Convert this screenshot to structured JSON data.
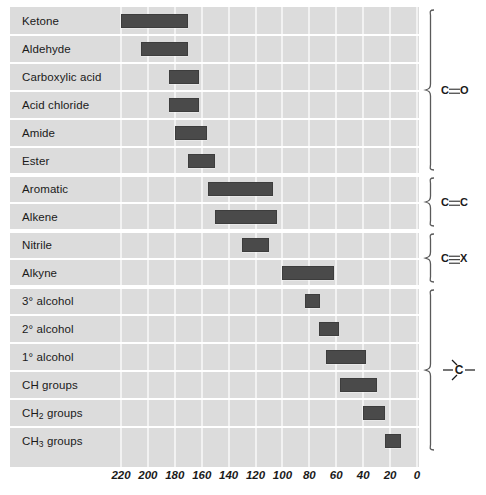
{
  "chart_data": {
    "type": "bar",
    "orientation": "horizontal-range",
    "title": "",
    "xlabel": "",
    "ylabel": "",
    "xlim": [
      220,
      0
    ],
    "x_reversed": true,
    "grid": true,
    "legend_position": "none",
    "tick_labels": [
      "220",
      "200",
      "180",
      "160",
      "140",
      "120",
      "100",
      "80",
      "60",
      "40",
      "20",
      "0"
    ],
    "ticks": [
      220,
      200,
      180,
      160,
      140,
      120,
      100,
      80,
      60,
      40,
      20,
      0
    ],
    "bar_color": "#4a4a4a",
    "plot_background": "#dcdcdc",
    "gridline_color": "#f2f2f2",
    "categories": [
      "Ketone",
      "Aldehyde",
      "Carboxylic acid",
      "Acid chloride",
      "Amide",
      "Ester",
      "Aromatic",
      "Alkene",
      "Nitrile",
      "Alkyne",
      "3° alcohol",
      "2° alcohol",
      "1° alcohol",
      "CH groups",
      "CH2 groups",
      "CH3 groups"
    ],
    "ranges": [
      {
        "label": "Ketone",
        "start": 220,
        "end": 170
      },
      {
        "label": "Aldehyde",
        "start": 205,
        "end": 170
      },
      {
        "label": "Carboxylic acid",
        "start": 184,
        "end": 162
      },
      {
        "label": "Acid chloride",
        "start": 184,
        "end": 162
      },
      {
        "label": "Amide",
        "start": 180,
        "end": 156
      },
      {
        "label": "Ester",
        "start": 170,
        "end": 150
      },
      {
        "label": "Aromatic",
        "start": 155,
        "end": 107
      },
      {
        "label": "Alkene",
        "start": 150,
        "end": 104
      },
      {
        "label": "Nitrile",
        "start": 130,
        "end": 110
      },
      {
        "label": "Alkyne",
        "start": 100,
        "end": 62
      },
      {
        "label": "3° alcohol",
        "start": 83,
        "end": 72
      },
      {
        "label": "2° alcohol",
        "start": 73,
        "end": 58
      },
      {
        "label": "1° alcohol",
        "start": 68,
        "end": 38
      },
      {
        "label": "CH groups",
        "start": 57,
        "end": 30
      },
      {
        "label": "CH2 groups",
        "start": 40,
        "end": 24
      },
      {
        "label": "CH3 groups",
        "start": 24,
        "end": 12
      }
    ]
  },
  "rows": [
    {
      "name": "ketone",
      "text": "Ketone",
      "sub": ""
    },
    {
      "name": "aldehyde",
      "text": "Aldehyde",
      "sub": ""
    },
    {
      "name": "carboxylic-acid",
      "text": "Carboxylic acid",
      "sub": ""
    },
    {
      "name": "acid-chloride",
      "text": "Acid chloride",
      "sub": ""
    },
    {
      "name": "amide",
      "text": "Amide",
      "sub": ""
    },
    {
      "name": "ester",
      "text": "Ester",
      "sub": ""
    },
    {
      "name": "aromatic",
      "text": "Aromatic",
      "sub": ""
    },
    {
      "name": "alkene",
      "text": "Alkene",
      "sub": ""
    },
    {
      "name": "nitrile",
      "text": "Nitrile",
      "sub": ""
    },
    {
      "name": "alkyne",
      "text": "Alkyne",
      "sub": ""
    },
    {
      "name": "tertiary-alcohol",
      "text": "3° alcohol",
      "sub": ""
    },
    {
      "name": "secondary-alcohol",
      "text": "2° alcohol",
      "sub": ""
    },
    {
      "name": "primary-alcohol",
      "text": "1° alcohol",
      "sub": ""
    },
    {
      "name": "ch-groups",
      "text": "CH groups",
      "sub": ""
    },
    {
      "name": "ch2-groups",
      "text": "CH",
      "sub": "2",
      "suffix": " groups"
    },
    {
      "name": "ch3-groups",
      "text": "CH",
      "sub": "3",
      "suffix": " groups"
    }
  ],
  "brackets": [
    {
      "name": "carbonyl",
      "label": "C=O",
      "kind": "double",
      "left": "C",
      "right": "O",
      "first_row": 0,
      "last_row": 5
    },
    {
      "name": "alkene-cc",
      "label": "C=C",
      "kind": "double",
      "left": "C",
      "right": "C",
      "first_row": 6,
      "last_row": 7
    },
    {
      "name": "triple-cx",
      "label": "C≡X",
      "kind": "triple",
      "left": "C",
      "right": "X",
      "first_row": 8,
      "last_row": 9
    },
    {
      "name": "sp3-carbon",
      "label": "C",
      "kind": "sp3",
      "left": "",
      "right": "",
      "first_row": 10,
      "last_row": 15
    }
  ]
}
